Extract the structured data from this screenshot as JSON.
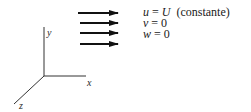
{
  "diagram": {
    "type": "uniform-flow",
    "axes": {
      "x_label": "x",
      "y_label": "y",
      "z_label": "z"
    },
    "flow_arrows": {
      "count": 4,
      "direction": "positive-x"
    },
    "equations": [
      {
        "lhs": "u",
        "op": "=",
        "rhs": "U",
        "note": "(constante)"
      },
      {
        "lhs": "v",
        "op": "=",
        "rhs": "0",
        "note": ""
      },
      {
        "lhs": "w",
        "op": "=",
        "rhs": "0",
        "note": ""
      }
    ]
  },
  "colors": {
    "ink": "#1a1a1a",
    "axis": "#333333",
    "background": "#ffffff"
  }
}
